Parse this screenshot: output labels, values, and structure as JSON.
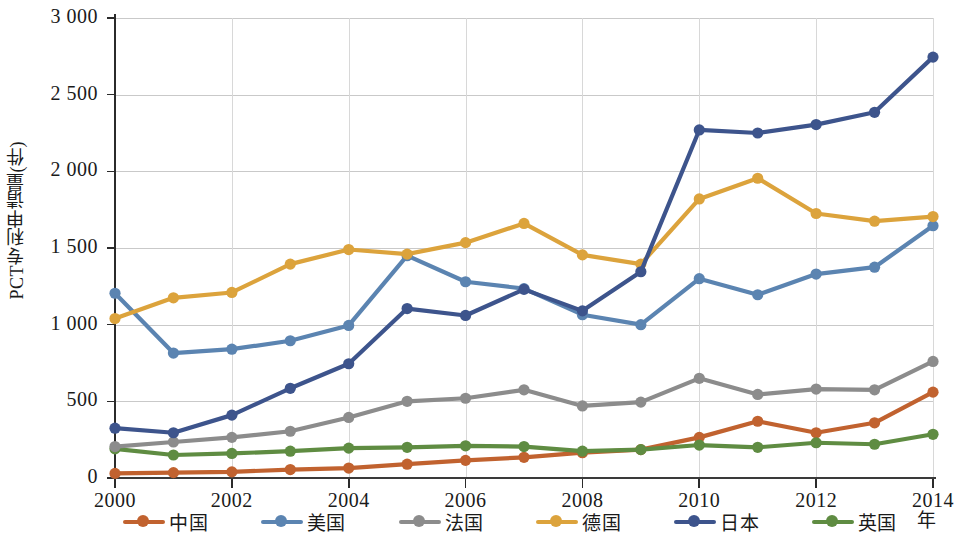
{
  "chart_data": {
    "type": "line",
    "title": "",
    "xlabel": "年",
    "ylabel": "PCT专利申请量(件)",
    "ylim": [
      0,
      3000
    ],
    "ytick_step": 500,
    "ytick_labels": [
      "3 000",
      "2 500",
      "2 000",
      "1 500",
      "1 000",
      "500",
      "0"
    ],
    "ytick_values": [
      3000,
      2500,
      2000,
      1500,
      1000,
      500,
      0
    ],
    "grid": true,
    "legend_position": "bottom",
    "x": [
      2000,
      2001,
      2002,
      2003,
      2004,
      2005,
      2006,
      2007,
      2008,
      2009,
      2010,
      2011,
      2012,
      2013,
      2014
    ],
    "xtick_labels": [
      "2000",
      "2002",
      "2004",
      "2006",
      "2008",
      "2010",
      "2012",
      "2014"
    ],
    "xtick_values": [
      2000,
      2002,
      2004,
      2006,
      2008,
      2010,
      2012,
      2014
    ],
    "series": [
      {
        "name": "中国",
        "color": "#c1622f",
        "values": [
          30,
          35,
          40,
          55,
          65,
          90,
          115,
          135,
          165,
          185,
          265,
          370,
          295,
          360,
          560
        ]
      },
      {
        "name": "美国",
        "color": "#5b84b1",
        "values": [
          1205,
          815,
          840,
          895,
          995,
          1450,
          1280,
          1235,
          1065,
          1000,
          1300,
          1195,
          1330,
          1375,
          1645
        ]
      },
      {
        "name": "法国",
        "color": "#8c8c8c",
        "values": [
          205,
          235,
          265,
          305,
          395,
          500,
          520,
          575,
          470,
          495,
          650,
          545,
          580,
          575,
          760
        ]
      },
      {
        "name": "德国",
        "color": "#dca33c",
        "values": [
          1040,
          1175,
          1210,
          1395,
          1490,
          1460,
          1535,
          1660,
          1455,
          1395,
          1820,
          1955,
          1725,
          1675,
          1705
        ]
      },
      {
        "name": "日本",
        "color": "#3d548c",
        "values": [
          325,
          295,
          410,
          585,
          745,
          1105,
          1060,
          1230,
          1090,
          1345,
          2270,
          2250,
          2305,
          2385,
          2745
        ]
      },
      {
        "name": "英国",
        "color": "#5f8c42",
        "values": [
          190,
          150,
          160,
          175,
          195,
          200,
          210,
          205,
          175,
          185,
          215,
          200,
          230,
          220,
          285
        ]
      }
    ]
  }
}
